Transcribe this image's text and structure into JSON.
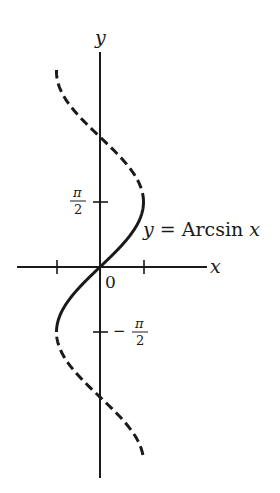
{
  "chart_data": {
    "type": "line",
    "title": "",
    "function": "x = sin(y), principal branch y = Arcsin x",
    "xlabel": "x",
    "ylabel": "y",
    "origin_label": "0",
    "x_ticks": [
      -1,
      1
    ],
    "y_ticks": [
      {
        "value": 1.5708,
        "label_num": "π",
        "label_den": "2",
        "sign": ""
      },
      {
        "value": -1.5708,
        "label_num": "π",
        "label_den": "2",
        "sign": "−"
      }
    ],
    "series": [
      {
        "name": "x = sin y (upper, dashed)",
        "style": "dashed",
        "y_range": [
          1.5708,
          4.76
        ]
      },
      {
        "name": "y = Arcsin x",
        "style": "solid",
        "y_range": [
          -1.5708,
          1.5708
        ]
      },
      {
        "name": "x = sin y (lower, dashed)",
        "style": "dashed",
        "y_range": [
          -4.54,
          -1.5708
        ]
      }
    ],
    "annotation": {
      "var": "y",
      "eq": " = ",
      "fn": "Arcsin",
      "arg": "x"
    },
    "xlim": [
      -1.9,
      2.45
    ],
    "ylim": [
      -5.0,
      5.3
    ],
    "grid": false,
    "legend": "none",
    "color": "#1a1a1a"
  }
}
